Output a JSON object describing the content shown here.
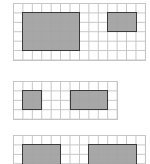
{
  "cell": 9.43,
  "colors": {
    "grid_line": "#c4c4c4",
    "rect_fill": "#a3a3a3",
    "rect_border": "#333333"
  },
  "grids": [
    {
      "name": "grid-1",
      "x": 13,
      "y": 3,
      "cols": 14,
      "rows": 6,
      "rects": [
        {
          "col": 1,
          "row": 1,
          "w": 6,
          "h": 4
        },
        {
          "col": 10,
          "row": 1,
          "w": 3,
          "h": 2
        }
      ]
    },
    {
      "name": "grid-2",
      "x": 13,
      "y": 81,
      "cols": 11,
      "rows": 4,
      "rects": [
        {
          "col": 1,
          "row": 1,
          "w": 2,
          "h": 2
        },
        {
          "col": 6,
          "row": 1,
          "w": 4,
          "h": 2
        }
      ]
    },
    {
      "name": "grid-3",
      "x": 13,
      "y": 135,
      "cols": 14,
      "rows": 4,
      "rects": [
        {
          "col": 1,
          "row": 1,
          "w": 4,
          "h": 3
        },
        {
          "col": 8,
          "row": 1,
          "w": 5,
          "h": 3
        }
      ]
    }
  ]
}
